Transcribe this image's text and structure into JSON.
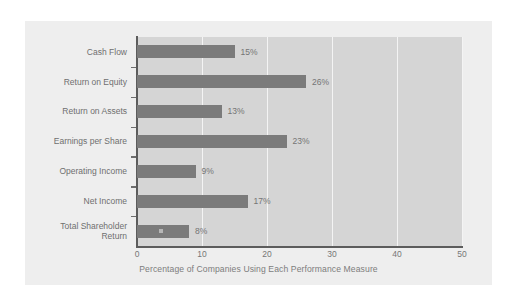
{
  "chart_data": {
    "type": "bar",
    "orientation": "horizontal",
    "title": "",
    "xlabel": "Percentage of Companies Using Each Performance Measure",
    "ylabel": "",
    "categories": [
      "Cash Flow",
      "Return on Equity",
      "Return on Assets",
      "Earnings per Share",
      "Operating Income",
      "Net Income",
      "Total Shareholder Return"
    ],
    "category_lines": [
      [
        "Cash Flow"
      ],
      [
        "Return on Equity"
      ],
      [
        "Return on Assets"
      ],
      [
        "Earnings per Share"
      ],
      [
        "Operating Income"
      ],
      [
        "Net Income"
      ],
      [
        "Total Shareholder",
        "Return"
      ]
    ],
    "values": [
      15,
      26,
      13,
      23,
      9,
      17,
      8
    ],
    "data_labels": [
      "15%",
      "26%",
      "13%",
      "23%",
      "9%",
      "17%",
      "8%"
    ],
    "xlim": [
      0,
      50
    ],
    "xticks": [
      0,
      10,
      20,
      30,
      40,
      50
    ],
    "xtick_labels": [
      "0",
      "10",
      "20",
      "30",
      "40",
      "50"
    ],
    "grid": "vertical-white-at-xticks",
    "legend": "none",
    "colors": {
      "bar": "#7b7b7b",
      "plot_background": "#d5d5d5",
      "card_background": "#eeeeee",
      "page_background": "#ffffff",
      "gridline": "#f4f4f4",
      "axis_line": "#5c5c5c",
      "label_text": "#6f6f6f",
      "value_text": "#747474",
      "tick_text": "#777777",
      "axis_title_text": "#7d7d7d"
    }
  }
}
